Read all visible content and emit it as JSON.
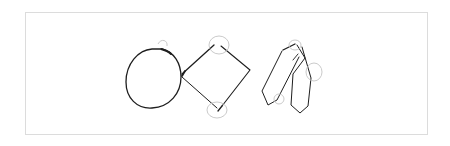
{
  "canvas": {
    "background": "#ffffff",
    "border_color": "#dcdcdc",
    "ink_color": "#1e1e1e",
    "ghost_color": "#c4c4c4"
  },
  "sketch": {
    "shapes": [
      {
        "name": "circle",
        "label": ""
      },
      {
        "name": "diamond",
        "label": ""
      },
      {
        "name": "parallelogram-pair",
        "label": ""
      }
    ],
    "annotations": [
      "top-arc-marker",
      "diamond-top-marker",
      "diamond-bottom-marker",
      "tie-top-marker",
      "tie-right-marker",
      "tie-bottom-marker"
    ]
  }
}
